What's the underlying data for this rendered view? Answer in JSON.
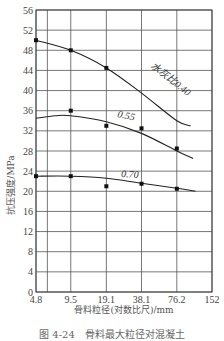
{
  "chart_data": {
    "type": "line",
    "title": "",
    "xlabel": "骨料粒径(对数比尺)/mm",
    "ylabel": "抗压强度/MPa",
    "x_scale": "log",
    "x_ticks": [
      "4.8",
      "9.5",
      "19.1",
      "38.1",
      "76.2",
      "152"
    ],
    "y_ticks": [
      0,
      4,
      8,
      12,
      16,
      20,
      24,
      28,
      32,
      36,
      40,
      44,
      48,
      52,
      56
    ],
    "ylim": [
      0,
      56
    ],
    "grid": true,
    "series": [
      {
        "name": "水灰比0.40",
        "points": [
          [
            4.8,
            50
          ],
          [
            9.5,
            48
          ],
          [
            19.1,
            44.5
          ]
        ],
        "curve": [
          [
            4.8,
            50
          ],
          [
            9.5,
            48
          ],
          [
            19.1,
            44.5
          ],
          [
            38.1,
            39.5
          ],
          [
            76.2,
            34
          ],
          [
            100,
            33
          ]
        ]
      },
      {
        "name": "0.55",
        "points": [
          [
            9.5,
            36
          ],
          [
            19.1,
            33
          ],
          [
            38.1,
            32.5
          ],
          [
            76.2,
            28.5
          ]
        ],
        "curve": [
          [
            4.8,
            34.5
          ],
          [
            7,
            35
          ],
          [
            9.5,
            35
          ],
          [
            19.1,
            33.8
          ],
          [
            38.1,
            31.5
          ],
          [
            76.2,
            28
          ],
          [
            105,
            26.5
          ]
        ]
      },
      {
        "name": "0.70",
        "points": [
          [
            4.8,
            23
          ],
          [
            9.5,
            23
          ],
          [
            19.1,
            21
          ],
          [
            38.1,
            21.5
          ],
          [
            76.2,
            20.5
          ]
        ],
        "curve": [
          [
            4.8,
            23
          ],
          [
            9.5,
            23
          ],
          [
            19.1,
            22.6
          ],
          [
            38.1,
            21.6
          ],
          [
            76.2,
            20.6
          ],
          [
            110,
            20
          ]
        ]
      }
    ]
  },
  "labels": {
    "series_040": "水灰比0.40",
    "series_055": "0.55",
    "series_070": "0.70",
    "xlabel": "骨料粒径(对数比尺)/mm",
    "ylabel": "抗压强度/MPa",
    "caption": "图 4-24　骨料最大粒径对混凝土"
  }
}
